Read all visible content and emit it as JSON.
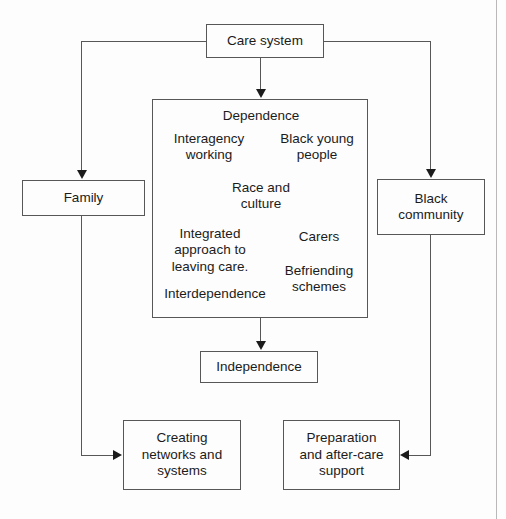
{
  "diagram": {
    "type": "flow-diagram",
    "background_color": "#fdfdfd",
    "line_color": "#575757",
    "text_color": "#1b1b1b",
    "nodes": {
      "care_system": "Care system",
      "family": "Family",
      "black_community": "Black\ncommunity",
      "independence": "Independence",
      "creating_networks": "Creating\nnetworks and\nsystems",
      "preparation": "Preparation\nand after-care\nsupport"
    },
    "cluster": {
      "title": "Dependence",
      "labels": {
        "interagency_working": "Interagency\nworking",
        "black_young_people": "Black young\npeople",
        "race_and_culture": "Race and\nculture",
        "integrated_approach": "Integrated\napproach to\nleaving care.",
        "carers": "Carers",
        "befriending_schemes": "Befriending\nschemes",
        "interdependence": "Interdependence"
      }
    },
    "connections": [
      {
        "from": "care_system",
        "to": "family",
        "arrow": "down"
      },
      {
        "from": "care_system",
        "to": "black_community",
        "arrow": "down"
      },
      {
        "from": "care_system",
        "to": "dependence_cluster",
        "arrow": "down"
      },
      {
        "from": "dependence_cluster",
        "to": "independence",
        "arrow": "down"
      },
      {
        "from": "family",
        "to": "creating_networks",
        "arrow": "right"
      },
      {
        "from": "black_community",
        "to": "preparation",
        "arrow": "left"
      }
    ]
  }
}
